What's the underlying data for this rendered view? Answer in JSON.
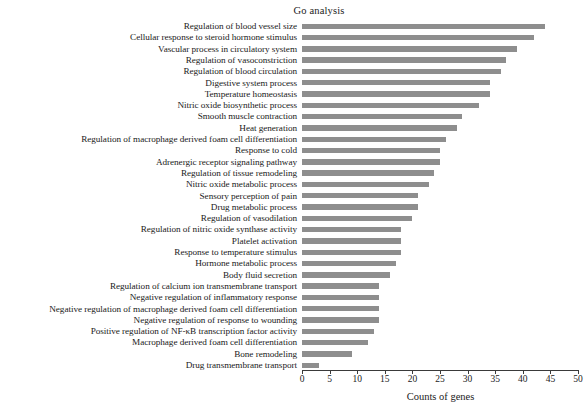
{
  "chart_data": {
    "type": "bar",
    "orientation": "horizontal",
    "title": "Go analysis",
    "xlabel": "Counts of genes",
    "ylabel": "",
    "xlim": [
      0,
      50
    ],
    "xticks": [
      0,
      5,
      10,
      15,
      20,
      25,
      30,
      35,
      40,
      45,
      50
    ],
    "grid": false,
    "legend": null,
    "bar_color": "#8e8e8e",
    "categories": [
      "Regulation of blood vessel size",
      "Cellular response to steroid hormone stimulus",
      "Vascular process in circulatory system",
      "Regulation of vasoconstriction",
      "Regulation of blood circulation",
      "Digestive system process",
      "Temperature homeostasis",
      "Nitric oxide biosynthetic process",
      "Smooth muscle contraction",
      "Heat generation",
      "Regulation of macrophage derived foam cell differentiation",
      "Response to cold",
      "Adrenergic receptor signaling pathway",
      "Regulation of tissue remodeling",
      "Nitric oxide metabolic process",
      "Sensory perception of pain",
      "Drug metabolic process",
      "Regulation of vasodilation",
      "Regulation of nitric oxide synthase activity",
      "Platelet activation",
      "Response to temperature stimulus",
      "Hormone metabolic process",
      "Body fluid secretion",
      "Regulation of calcium ion transmembrane transport",
      "Negative regulation of inflammatory response",
      "Negative regulation of macrophage derived foam cell differentiation",
      "Negative regulation of response to wounding",
      "Positive regulation of NF-κB transcription factor activity",
      "Macrophage derived foam cell differentiation",
      "Bone remodeling",
      "Drug transmembrane transport"
    ],
    "values": [
      44,
      42,
      39,
      37,
      36,
      34,
      34,
      32,
      29,
      28,
      26,
      25,
      25,
      24,
      23,
      21,
      21,
      20,
      18,
      18,
      18,
      17,
      16,
      14,
      14,
      14,
      14,
      13,
      12,
      9,
      3
    ]
  },
  "axis": {
    "tick_labels": [
      "0",
      "5",
      "10",
      "15",
      "20",
      "25",
      "30",
      "35",
      "40",
      "45",
      "50"
    ]
  }
}
